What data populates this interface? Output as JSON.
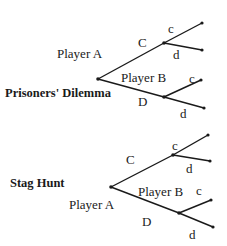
{
  "colors": {
    "line": "#1a1a1a",
    "background": "#ffffff"
  },
  "games": [
    {
      "title": "Prisoners' Dilemma",
      "first_mover": "Player A",
      "second_mover": "Player B",
      "a_moves": [
        "C",
        "D"
      ],
      "b_upper_moves": [
        "c",
        "d"
      ],
      "b_lower_moves": [
        "c",
        "d"
      ]
    },
    {
      "title": "Stag Hunt",
      "first_mover": "Player A",
      "second_mover": "Player B",
      "a_moves": [
        "C",
        "D"
      ],
      "b_upper_moves": [
        "c",
        "d"
      ],
      "b_lower_moves": [
        "c",
        "d"
      ]
    }
  ]
}
